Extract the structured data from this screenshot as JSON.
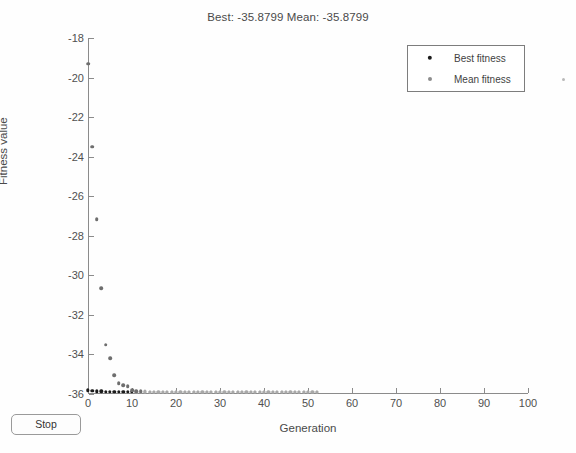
{
  "window": {
    "title": "Best: -35.8799 Mean: -35.8799"
  },
  "controls": {
    "stop_label": "Stop"
  },
  "legend": {
    "position": "top-right",
    "entries": [
      {
        "label": "Best fitness",
        "marker": "filled-circle",
        "color": "#1b1b1b"
      },
      {
        "label": "Mean fitness",
        "marker": "filled-circle",
        "color": "#8d8d8d"
      }
    ]
  },
  "chart_data": {
    "type": "scatter",
    "title": "Best: -35.8799 Mean: -35.8799",
    "xlabel": "Generation",
    "ylabel": "Fitness value",
    "xlim": [
      0,
      100
    ],
    "ylim": [
      -36,
      -18
    ],
    "xticks": [
      0,
      10,
      20,
      30,
      40,
      50,
      60,
      70,
      80,
      90,
      100
    ],
    "yticks": [
      -18,
      -20,
      -22,
      -24,
      -26,
      -28,
      -30,
      -32,
      -34,
      -36
    ],
    "grid": false,
    "best_value": -35.8799,
    "mean_value": -35.8799,
    "series": [
      {
        "name": "Best fitness",
        "color": "#1b1b1b",
        "x": [
          0,
          1,
          2,
          3,
          4,
          5,
          6,
          7,
          8,
          9,
          10,
          11,
          12,
          13,
          14,
          15,
          16,
          17,
          18,
          19,
          20,
          21,
          22,
          23,
          24,
          25,
          26,
          27,
          28,
          29,
          30,
          31,
          32,
          33,
          34,
          35,
          36,
          37,
          38,
          39,
          40,
          41,
          42,
          43,
          44,
          45,
          46,
          47,
          48,
          49,
          50,
          51,
          52
        ],
        "y": [
          -35.82,
          -35.85,
          -35.86,
          -35.87,
          -35.875,
          -35.878,
          -35.8785,
          -35.879,
          -35.8792,
          -35.8794,
          -35.8795,
          -35.8796,
          -35.8797,
          -35.8797,
          -35.8798,
          -35.8798,
          -35.8798,
          -35.8799,
          -35.8799,
          -35.8799,
          -35.8799,
          -35.8799,
          -35.8799,
          -35.8799,
          -35.8799,
          -35.8799,
          -35.8799,
          -35.8799,
          -35.8799,
          -35.8799,
          -35.8799,
          -35.8799,
          -35.8799,
          -35.8799,
          -35.8799,
          -35.8799,
          -35.8799,
          -35.8799,
          -35.8799,
          -35.8799,
          -35.8799,
          -35.8799,
          -35.8799,
          -35.8799,
          -35.8799,
          -35.8799,
          -35.8799,
          -35.8799,
          -35.8799,
          -35.8799,
          -35.8799,
          -35.8799,
          -35.8799
        ]
      },
      {
        "name": "Mean fitness",
        "color": "#6e6e6e",
        "x": [
          0,
          1,
          2,
          3,
          4,
          5,
          6,
          7,
          8,
          9,
          10,
          11,
          12,
          13,
          14,
          15,
          16,
          17,
          18,
          19,
          20,
          21,
          22,
          23,
          24,
          25,
          26,
          27,
          28,
          29,
          30,
          31,
          32,
          33,
          34,
          35,
          36,
          37,
          38,
          39,
          40,
          41,
          42,
          43,
          44,
          45,
          46,
          47,
          48,
          49,
          50,
          51,
          52
        ],
        "y": [
          -19.3,
          -23.5,
          -27.15,
          -30.65,
          -33.5,
          -34.2,
          -35.05,
          -35.45,
          -35.55,
          -35.6,
          -35.82,
          -35.85,
          -35.86,
          -35.87,
          -35.875,
          -35.878,
          -35.879,
          -35.879,
          -35.8795,
          -35.8796,
          -35.8797,
          -35.8798,
          -35.8798,
          -35.8799,
          -35.8799,
          -35.8799,
          -35.8799,
          -35.8799,
          -35.8799,
          -35.8799,
          -35.8799,
          -35.8799,
          -35.8799,
          -35.8799,
          -35.8799,
          -35.8799,
          -35.8799,
          -35.8799,
          -35.8799,
          -35.8799,
          -35.8799,
          -35.8799,
          -35.8799,
          -35.8799,
          -35.8799,
          -35.8799,
          -35.8799,
          -35.8799,
          -35.8799,
          -35.8799,
          -35.8799,
          -35.8799,
          -35.8799
        ]
      }
    ]
  }
}
